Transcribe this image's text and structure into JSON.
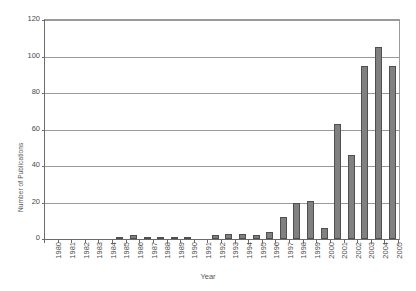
{
  "chart_data": {
    "type": "bar",
    "title": "",
    "xlabel": "Year",
    "ylabel": "Number of Publications",
    "categories": [
      "1980",
      "1981",
      "1982",
      "1983",
      "1984",
      "1985",
      "1986",
      "1987",
      "1988",
      "1989",
      "1990",
      "1991",
      "1992",
      "1993",
      "1994",
      "1995",
      "1996",
      "1997",
      "1998",
      "1999",
      "2000",
      "2001",
      "2002",
      "2003",
      "2004",
      "2005"
    ],
    "values": [
      0,
      0,
      0,
      0,
      0,
      1,
      2,
      1,
      1,
      1,
      1,
      0,
      2,
      3,
      3,
      2,
      4,
      12,
      20,
      21,
      6,
      63,
      46,
      95,
      105,
      95
    ],
    "ylim": [
      0,
      120
    ],
    "yticks": [
      0,
      20,
      40,
      60,
      80,
      100,
      120
    ],
    "ytick_labels": [
      "0",
      "20",
      "40",
      "60",
      "80",
      "100",
      "120"
    ],
    "grid": true,
    "legend": "none",
    "bar_color": "#808080",
    "bar_border_color": "#4f4f4f",
    "gridline_color": "#9a9a9a",
    "axis_color": "#6b6b6b",
    "plot_background": "#ffffff"
  }
}
